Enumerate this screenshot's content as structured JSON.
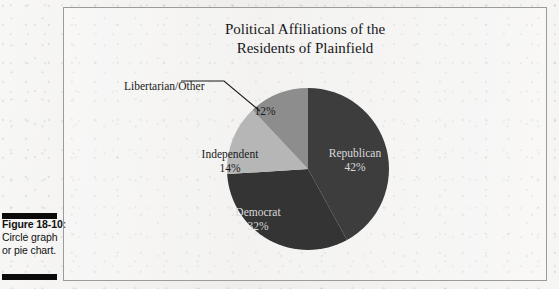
{
  "figure": {
    "caption_label": "Figure 18-10:",
    "caption_line_1": "Circle graph",
    "caption_line_2": "or pie chart."
  },
  "chart_data": {
    "type": "pie",
    "title": "Political Affiliations of the Residents of Plainfield",
    "title_line_1": "Political Affiliations of the",
    "title_line_2": "Residents of Plainfield",
    "xlabel": "",
    "ylabel": "",
    "legend_position": "none",
    "grid": false,
    "labels_inside": true,
    "categories": [
      "Republican",
      "Democrat",
      "Independent",
      "Libertarian/Other"
    ],
    "values": [
      42,
      32,
      14,
      12
    ],
    "units": "percent",
    "slices": [
      {
        "name": "Republican",
        "pct_label": "42%",
        "value": 42,
        "color": "#3d3d3d",
        "label_color": "#d9d9d9"
      },
      {
        "name": "Democrat",
        "pct_label": "32%",
        "value": 32,
        "color": "#343434",
        "label_color": "#d9d9d9"
      },
      {
        "name": "Independent",
        "pct_label": "14%",
        "value": 14,
        "color": "#b6b6b6",
        "label_color": "#1a1a1a"
      },
      {
        "name": "Libertarian/Other",
        "pct_label": "12%",
        "value": 12,
        "color": "#8d8d8d",
        "label_color": "#1a1a1a"
      }
    ],
    "start_angle_deg": 0,
    "direction": "clockwise",
    "leader_line": {
      "for_slice": "Libertarian/Other",
      "label_text": "Libertarian/Other"
    }
  },
  "colors": {
    "page_background": "#efeeec",
    "frame_border": "#9b9b9b",
    "caption_rule": "#0b0b0b",
    "title_text": "#17171a"
  }
}
